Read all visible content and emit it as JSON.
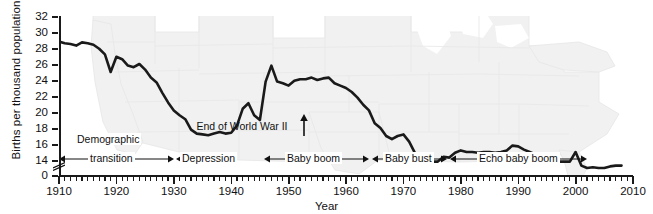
{
  "chart_data": {
    "type": "line",
    "title": "",
    "xlabel": "Year",
    "ylabel": "Births per thousand population",
    "xlim": [
      1910,
      2010
    ],
    "ylim": [
      13,
      33
    ],
    "y_axis_broken_at": 0,
    "grid": false,
    "legend": "none",
    "x_tick_labels": [
      "1910",
      "1920",
      "1930",
      "1940",
      "1950",
      "1960",
      "1970",
      "1980",
      "1990",
      "2000",
      "2010"
    ],
    "y_tick_labels": [
      "0",
      "14",
      "16",
      "18",
      "20",
      "22",
      "24",
      "26",
      "28",
      "30",
      "32"
    ],
    "x_minor_tick_interval": 1,
    "series": [
      {
        "name": "Births per thousand population",
        "color": "#1a1a1a",
        "x": [
          1910,
          1911,
          1912,
          1913,
          1914,
          1915,
          1916,
          1917,
          1918,
          1919,
          1920,
          1921,
          1922,
          1923,
          1924,
          1925,
          1926,
          1927,
          1928,
          1929,
          1930,
          1931,
          1932,
          1933,
          1934,
          1935,
          1936,
          1937,
          1938,
          1939,
          1940,
          1941,
          1942,
          1943,
          1944,
          1945,
          1946,
          1947,
          1948,
          1949,
          1950,
          1951,
          1952,
          1953,
          1954,
          1955,
          1956,
          1957,
          1958,
          1959,
          1960,
          1961,
          1962,
          1963,
          1964,
          1965,
          1966,
          1967,
          1968,
          1969,
          1970,
          1971,
          1972,
          1973,
          1974,
          1975,
          1976,
          1977,
          1978,
          1979,
          1980,
          1981,
          1982,
          1983,
          1984,
          1985,
          1986,
          1987,
          1988,
          1989,
          1990,
          1991,
          1992,
          1993,
          1994,
          1995,
          1996,
          1997,
          1998,
          1999,
          2000,
          2001,
          2002,
          2003,
          2004,
          2005,
          2006,
          2007,
          2008
        ],
        "values": [
          29.8,
          29.6,
          29.5,
          29.3,
          29.7,
          29.6,
          29.4,
          28.9,
          28.2,
          26.0,
          27.9,
          27.6,
          26.8,
          26.6,
          27.0,
          26.3,
          25.3,
          24.7,
          23.4,
          22.2,
          21.2,
          20.6,
          20.1,
          18.8,
          18.3,
          18.2,
          18.1,
          18.3,
          18.5,
          18.3,
          18.4,
          19.3,
          21.4,
          22.1,
          20.6,
          20.0,
          24.8,
          26.8,
          24.8,
          24.6,
          24.3,
          24.9,
          25.1,
          25.1,
          25.3,
          25.0,
          25.2,
          25.3,
          24.6,
          24.3,
          24.0,
          23.5,
          22.8,
          21.9,
          21.2,
          19.6,
          19.0,
          18.0,
          17.6,
          18.0,
          18.2,
          17.3,
          15.9,
          15.0,
          14.9,
          14.8,
          14.8,
          15.4,
          15.3,
          15.9,
          16.2,
          16.0,
          16.0,
          15.9,
          16.0,
          16.0,
          15.9,
          16.0,
          16.2,
          16.8,
          16.7,
          16.3,
          16.0,
          15.7,
          15.4,
          15.0,
          14.9,
          14.8,
          14.8,
          14.8,
          16.0,
          14.3,
          14.0,
          14.1,
          14.0,
          14.0,
          14.2,
          14.3,
          14.3
        ],
        "notes": "Annual US crude birth rate; values estimated from plotted curve"
      }
    ],
    "annotations": [
      {
        "name": "end-of-wwii",
        "label": "End of World War II",
        "year": 1946,
        "type": "arrow-up"
      },
      {
        "name": "demographic-transition",
        "label": "Demographic transition",
        "start_year": 1910,
        "end_year": 1930,
        "type": "span"
      },
      {
        "name": "depression",
        "label": "Depression",
        "start_year": 1930,
        "end_year": 1940,
        "type": "span"
      },
      {
        "name": "baby-boom",
        "label": "Baby boom",
        "start_year": 1946,
        "end_year": 1964,
        "type": "span"
      },
      {
        "name": "baby-bust",
        "label": "Baby bust",
        "start_year": 1964,
        "end_year": 1977,
        "type": "span"
      },
      {
        "name": "echo-baby-boom",
        "label": "Echo baby boom",
        "start_year": 1977,
        "end_year": 2001,
        "type": "span"
      }
    ],
    "background": {
      "watermark": "united-states-map",
      "color": "#e8e8e8"
    }
  },
  "axis": {
    "y_title": "Births per thousand population",
    "x_title": "Year"
  },
  "annotations": {
    "wwii": "End of World War II",
    "demographic_transition_line1": "Demographic",
    "demographic_transition_line2": "transition",
    "depression": "Depression",
    "baby_boom": "Baby boom",
    "baby_bust": "Baby bust",
    "echo_baby_boom": "Echo baby boom"
  }
}
